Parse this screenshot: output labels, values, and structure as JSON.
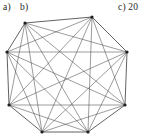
{
  "figure": {
    "caption_labels": [
      {
        "id": "a",
        "text": "a)"
      },
      {
        "id": "b",
        "text": "b)"
      },
      {
        "id": "c",
        "text": "c) 20"
      }
    ],
    "background_color": "#ffffff",
    "edge_color": "#4a4a4a",
    "hull_edge_color": "#3a3a3a",
    "vertex_color": "#1f1f1f"
  },
  "chart_data": {
    "type": "diagram",
    "subtype": "graph-node-link",
    "title": "",
    "xlabel": "",
    "ylabel": "",
    "layout": "octagonal-ring",
    "node_count": 8,
    "edge_count": 25,
    "nodes": [
      {
        "id": 0,
        "label": "",
        "x": 25,
        "y": 23
      },
      {
        "id": 1,
        "label": "",
        "x": 92,
        "y": 17
      },
      {
        "id": 2,
        "label": "",
        "x": 127,
        "y": 52
      },
      {
        "id": 3,
        "label": "",
        "x": 125,
        "y": 105
      },
      {
        "id": 4,
        "label": "",
        "x": 88,
        "y": 132
      },
      {
        "id": 5,
        "label": "",
        "x": 42,
        "y": 132
      },
      {
        "id": 6,
        "label": "",
        "x": 9,
        "y": 105
      },
      {
        "id": 7,
        "label": "",
        "x": 7,
        "y": 52
      }
    ],
    "hull_edges": [
      [
        0,
        1
      ],
      [
        1,
        2
      ],
      [
        2,
        3
      ],
      [
        3,
        4
      ],
      [
        4,
        5
      ],
      [
        5,
        6
      ],
      [
        6,
        7
      ],
      [
        7,
        0
      ]
    ],
    "chord_edges": [
      [
        0,
        2
      ],
      [
        0,
        3
      ],
      [
        0,
        4
      ],
      [
        0,
        5
      ],
      [
        0,
        6
      ],
      [
        1,
        3
      ],
      [
        1,
        4
      ],
      [
        1,
        5
      ],
      [
        1,
        6
      ],
      [
        1,
        7
      ],
      [
        2,
        4
      ],
      [
        2,
        5
      ],
      [
        2,
        6
      ],
      [
        2,
        7
      ],
      [
        3,
        5
      ],
      [
        3,
        6
      ],
      [
        3,
        7
      ],
      [
        4,
        6
      ],
      [
        4,
        7
      ],
      [
        5,
        7
      ]
    ],
    "vertex_radius": 1.6
  }
}
